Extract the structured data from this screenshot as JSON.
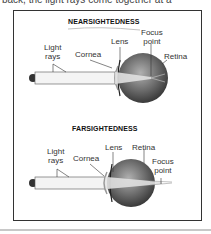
{
  "header_text": "back, the light rays come together at a",
  "panels": [
    {
      "title": "NEARSIGHTEDNESS",
      "labels": {
        "light_rays_line1": "Light",
        "light_rays_line2": "rays",
        "cornea": "Cornea",
        "lens": "Lens",
        "focus_point_line1": "Focus",
        "focus_point_line2": "point",
        "retina": "Retina"
      }
    },
    {
      "title": "FARSIGHTEDNESS",
      "labels": {
        "light_rays_line1": "Light",
        "light_rays_line2": "rays",
        "cornea": "Cornea",
        "lens": "Lens",
        "retina": "Retina",
        "focus_point_line1": "Focus",
        "focus_point_line2": "point"
      }
    }
  ],
  "colors": {
    "frame": "#333333",
    "eye_dark": "#555555",
    "eye_light": "#d8d8d8",
    "beam": "#eeeeee"
  }
}
